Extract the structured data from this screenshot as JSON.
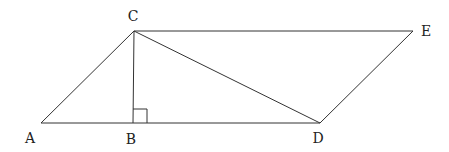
{
  "diagram": {
    "type": "geometry",
    "points": {
      "A": {
        "label": "A",
        "x": 41,
        "y": 123,
        "lx": 30,
        "ly": 143
      },
      "B": {
        "label": "B",
        "x": 133,
        "y": 123,
        "lx": 131,
        "ly": 144
      },
      "C": {
        "label": "C",
        "x": 134,
        "y": 31,
        "lx": 133,
        "ly": 21
      },
      "D": {
        "label": "D",
        "x": 320,
        "y": 123,
        "lx": 318,
        "ly": 143
      },
      "E": {
        "label": "E",
        "x": 413,
        "y": 31,
        "lx": 426,
        "ly": 36
      }
    },
    "segments": [
      [
        "A",
        "D"
      ],
      [
        "A",
        "C"
      ],
      [
        "C",
        "E"
      ],
      [
        "E",
        "D"
      ],
      [
        "C",
        "B"
      ],
      [
        "C",
        "D"
      ]
    ],
    "right_angle": {
      "at": "B",
      "size": 14
    },
    "colors": {
      "stroke": "#333333",
      "text": "#222222",
      "background": "#ffffff"
    }
  }
}
